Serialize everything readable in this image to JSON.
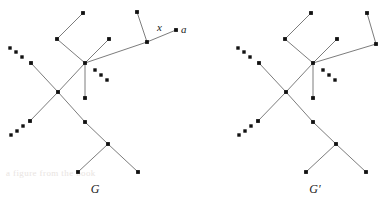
{
  "figure": {
    "background_color": "#ffffff",
    "edge_color": "#6d6d6d",
    "vertex_color": "#111111",
    "label_color": "#1a1a1a",
    "watermark_text": "a figure from the book"
  },
  "labels": {
    "x_label": "x",
    "a_label": "a",
    "graph_left_name": "G",
    "graph_right_name": "G′"
  },
  "graphs": [
    {
      "id": "G",
      "name": "G",
      "name_position": {
        "x": 95,
        "y": 193
      },
      "vertices": [
        {
          "id": "g-top-left-leaf",
          "x": 83,
          "y": 13
        },
        {
          "id": "g-upper-left-node",
          "x": 57,
          "y": 39
        },
        {
          "id": "g-short-branch-tip",
          "x": 109,
          "y": 39
        },
        {
          "id": "g-hub",
          "x": 85,
          "y": 63
        },
        {
          "id": "g-hub-down-leaf",
          "x": 85,
          "y": 98
        },
        {
          "id": "g-x-vertex",
          "x": 147,
          "y": 42
        },
        {
          "id": "g-x-up-leaf",
          "x": 137,
          "y": 12
        },
        {
          "id": "g-a-vertex",
          "x": 176,
          "y": 30
        },
        {
          "id": "g-ul-chain-node",
          "x": 31,
          "y": 63
        },
        {
          "id": "g-cross-node",
          "x": 58,
          "y": 92
        },
        {
          "id": "g-ll-chain-node",
          "x": 30,
          "y": 121
        },
        {
          "id": "g-mid-lower-node",
          "x": 85,
          "y": 122
        },
        {
          "id": "g-fork-node",
          "x": 108,
          "y": 144
        },
        {
          "id": "g-fork-leaf-left",
          "x": 78,
          "y": 172
        },
        {
          "id": "g-fork-leaf-right",
          "x": 138,
          "y": 172
        }
      ],
      "edges": [
        [
          "g-top-left-leaf",
          "g-upper-left-node"
        ],
        [
          "g-upper-left-node",
          "g-hub"
        ],
        [
          "g-short-branch-tip",
          "g-hub"
        ],
        [
          "g-hub",
          "g-hub-down-leaf"
        ],
        [
          "g-hub",
          "g-x-vertex"
        ],
        [
          "g-x-vertex",
          "g-x-up-leaf"
        ],
        [
          "g-x-vertex",
          "g-a-vertex"
        ],
        [
          "g-ul-chain-node",
          "g-cross-node"
        ],
        [
          "g-cross-node",
          "g-hub"
        ],
        [
          "g-ll-chain-node",
          "g-cross-node"
        ],
        [
          "g-cross-node",
          "g-mid-lower-node"
        ],
        [
          "g-mid-lower-node",
          "g-fork-node"
        ],
        [
          "g-fork-node",
          "g-fork-leaf-left"
        ],
        [
          "g-fork-node",
          "g-fork-leaf-right"
        ]
      ],
      "ellipses": [
        {
          "id": "g-ellipsis-upper-left",
          "dots": [
            [
              10,
              48
            ],
            [
              16,
              52
            ],
            [
              22,
              57
            ]
          ]
        },
        {
          "id": "g-ellipsis-lower-left",
          "dots": [
            [
              11,
              135
            ],
            [
              17,
              131
            ],
            [
              23,
              126
            ]
          ]
        },
        {
          "id": "g-ellipsis-hub-right",
          "dots": [
            [
              95,
              70
            ],
            [
              101,
              75
            ],
            [
              107,
              80
            ]
          ]
        }
      ],
      "annotations": [
        {
          "id": "g-x-annotation",
          "text": "x",
          "x": 157,
          "y": 31
        },
        {
          "id": "g-a-annotation",
          "text": "a",
          "x": 181,
          "y": 33
        }
      ]
    },
    {
      "id": "Gprime",
      "name": "G′",
      "name_position": {
        "x": 315,
        "y": 193
      },
      "vertices": [
        {
          "id": "gp-top-left-leaf",
          "x": 311,
          "y": 13
        },
        {
          "id": "gp-upper-left-node",
          "x": 285,
          "y": 39
        },
        {
          "id": "gp-short-branch-tip",
          "x": 337,
          "y": 39
        },
        {
          "id": "gp-hub",
          "x": 313,
          "y": 63
        },
        {
          "id": "gp-hub-down-leaf",
          "x": 313,
          "y": 98
        },
        {
          "id": "gp-x-vertex",
          "x": 376,
          "y": 44
        },
        {
          "id": "gp-x-up-leaf",
          "x": 367,
          "y": 13
        },
        {
          "id": "gp-ul-chain-node",
          "x": 259,
          "y": 63
        },
        {
          "id": "gp-cross-node",
          "x": 286,
          "y": 92
        },
        {
          "id": "gp-ll-chain-node",
          "x": 258,
          "y": 121
        },
        {
          "id": "gp-mid-lower-node",
          "x": 313,
          "y": 122
        },
        {
          "id": "gp-fork-node",
          "x": 336,
          "y": 144
        },
        {
          "id": "gp-fork-leaf-left",
          "x": 306,
          "y": 172
        },
        {
          "id": "gp-fork-leaf-right",
          "x": 366,
          "y": 172
        }
      ],
      "edges": [
        [
          "gp-top-left-leaf",
          "gp-upper-left-node"
        ],
        [
          "gp-upper-left-node",
          "gp-hub"
        ],
        [
          "gp-short-branch-tip",
          "gp-hub"
        ],
        [
          "gp-hub",
          "gp-hub-down-leaf"
        ],
        [
          "gp-hub",
          "gp-x-vertex"
        ],
        [
          "gp-x-vertex",
          "gp-x-up-leaf"
        ],
        [
          "gp-ul-chain-node",
          "gp-cross-node"
        ],
        [
          "gp-cross-node",
          "gp-hub"
        ],
        [
          "gp-ll-chain-node",
          "gp-cross-node"
        ],
        [
          "gp-cross-node",
          "gp-mid-lower-node"
        ],
        [
          "gp-mid-lower-node",
          "gp-fork-node"
        ],
        [
          "gp-fork-node",
          "gp-fork-leaf-left"
        ],
        [
          "gp-fork-node",
          "gp-fork-leaf-right"
        ]
      ],
      "ellipses": [
        {
          "id": "gp-ellipsis-upper-left",
          "dots": [
            [
              238,
              48
            ],
            [
              244,
              52
            ],
            [
              250,
              57
            ]
          ]
        },
        {
          "id": "gp-ellipsis-lower-left",
          "dots": [
            [
              239,
              135
            ],
            [
              245,
              131
            ],
            [
              251,
              126
            ]
          ]
        },
        {
          "id": "gp-ellipsis-hub-right",
          "dots": [
            [
              323,
              70
            ],
            [
              329,
              75
            ],
            [
              335,
              80
            ]
          ]
        }
      ],
      "annotations": []
    }
  ]
}
